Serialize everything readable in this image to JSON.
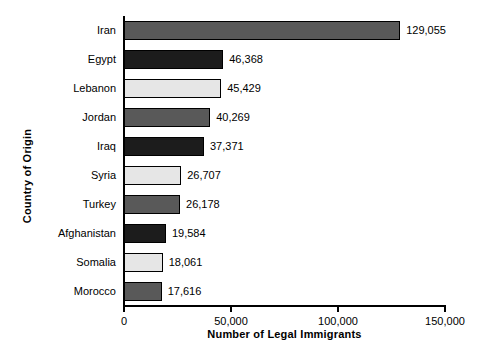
{
  "chart_data": {
    "type": "bar",
    "orientation": "horizontal",
    "title": "",
    "xlabel": "Number of Legal Immigrants",
    "ylabel": "Country of Origin",
    "xlim": [
      0,
      150000
    ],
    "xticks": [
      0,
      50000,
      100000,
      150000
    ],
    "xtick_labels": [
      "0",
      "50,000",
      "100,000",
      "150,000"
    ],
    "grid": false,
    "legend": null,
    "categories": [
      "Iran",
      "Egypt",
      "Lebanon",
      "Jordan",
      "Iraq",
      "Syria",
      "Turkey",
      "Afghanistan",
      "Somalia",
      "Morocco"
    ],
    "values": [
      129055,
      46368,
      45429,
      40269,
      37371,
      26707,
      26178,
      19584,
      18061,
      17616
    ],
    "value_labels": [
      "129,055",
      "46,368",
      "45,429",
      "40,269",
      "37,371",
      "26,707",
      "26,178",
      "19,584",
      "18,061",
      "17,616"
    ],
    "bar_colors": [
      "#595959",
      "#1c1c1c",
      "#e6e6e6",
      "#595959",
      "#1c1c1c",
      "#e6e6e6",
      "#595959",
      "#1c1c1c",
      "#e6e6e6",
      "#595959"
    ],
    "bar_edge_color": "#000000",
    "background_color": "#ffffff",
    "axis_color": "#000000"
  }
}
